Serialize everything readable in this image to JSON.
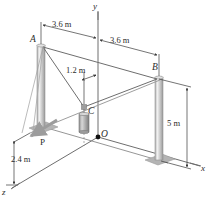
{
  "figure": {
    "background_color": "#ffffff",
    "line_color": "#6e6e6e",
    "dim_line_color": "#3a3a3a",
    "text_color": "#2b2b2b",
    "post_color": "#c9c9c9",
    "post_highlight_color": "#f2f2f2",
    "base_plate_color": "#b8b8b8",
    "weight_color": "#b0b0b0"
  },
  "axes": [
    {
      "name": "y-axis",
      "label": "y"
    },
    {
      "name": "x-axis",
      "label": "x"
    },
    {
      "name": "z-axis",
      "label": "z"
    }
  ],
  "points": [
    {
      "name": "point-a",
      "label": "A"
    },
    {
      "name": "point-b",
      "label": "B"
    },
    {
      "name": "point-c",
      "label": "C"
    },
    {
      "name": "origin",
      "label": "O"
    }
  ],
  "dimensions": [
    {
      "name": "dim-a-to-y",
      "label": "3.6 m"
    },
    {
      "name": "dim-y-to-b",
      "label": "3.6 m"
    },
    {
      "name": "dim-c-offset",
      "label": "1.2 m"
    },
    {
      "name": "dim-post-height",
      "label": "5 m"
    },
    {
      "name": "dim-z-depth",
      "label": "2.4 m"
    }
  ],
  "forces": [
    {
      "name": "force-p",
      "label": "P"
    }
  ]
}
